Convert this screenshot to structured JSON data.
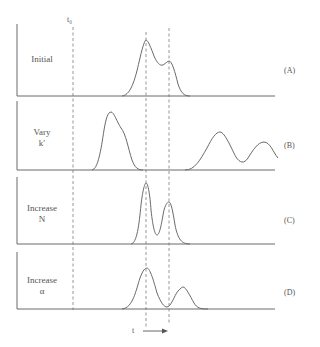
{
  "figure": {
    "t0_label": "t₀",
    "time_axis_label": "t",
    "colors": {
      "line": "#6a6a6a",
      "dash": "#8a8a8a",
      "text": "#555555"
    },
    "panels": [
      {
        "id": "A",
        "tag": "(A)",
        "label_line1": "Initial",
        "label_line2": ""
      },
      {
        "id": "B",
        "tag": "(B)",
        "label_line1": "Vary",
        "label_line2": "k′"
      },
      {
        "id": "C",
        "tag": "(C)",
        "label_line1": "Increase",
        "label_line2": "N"
      },
      {
        "id": "D",
        "tag": "(D)",
        "label_line1": "Increase",
        "label_line2": "α"
      }
    ]
  }
}
